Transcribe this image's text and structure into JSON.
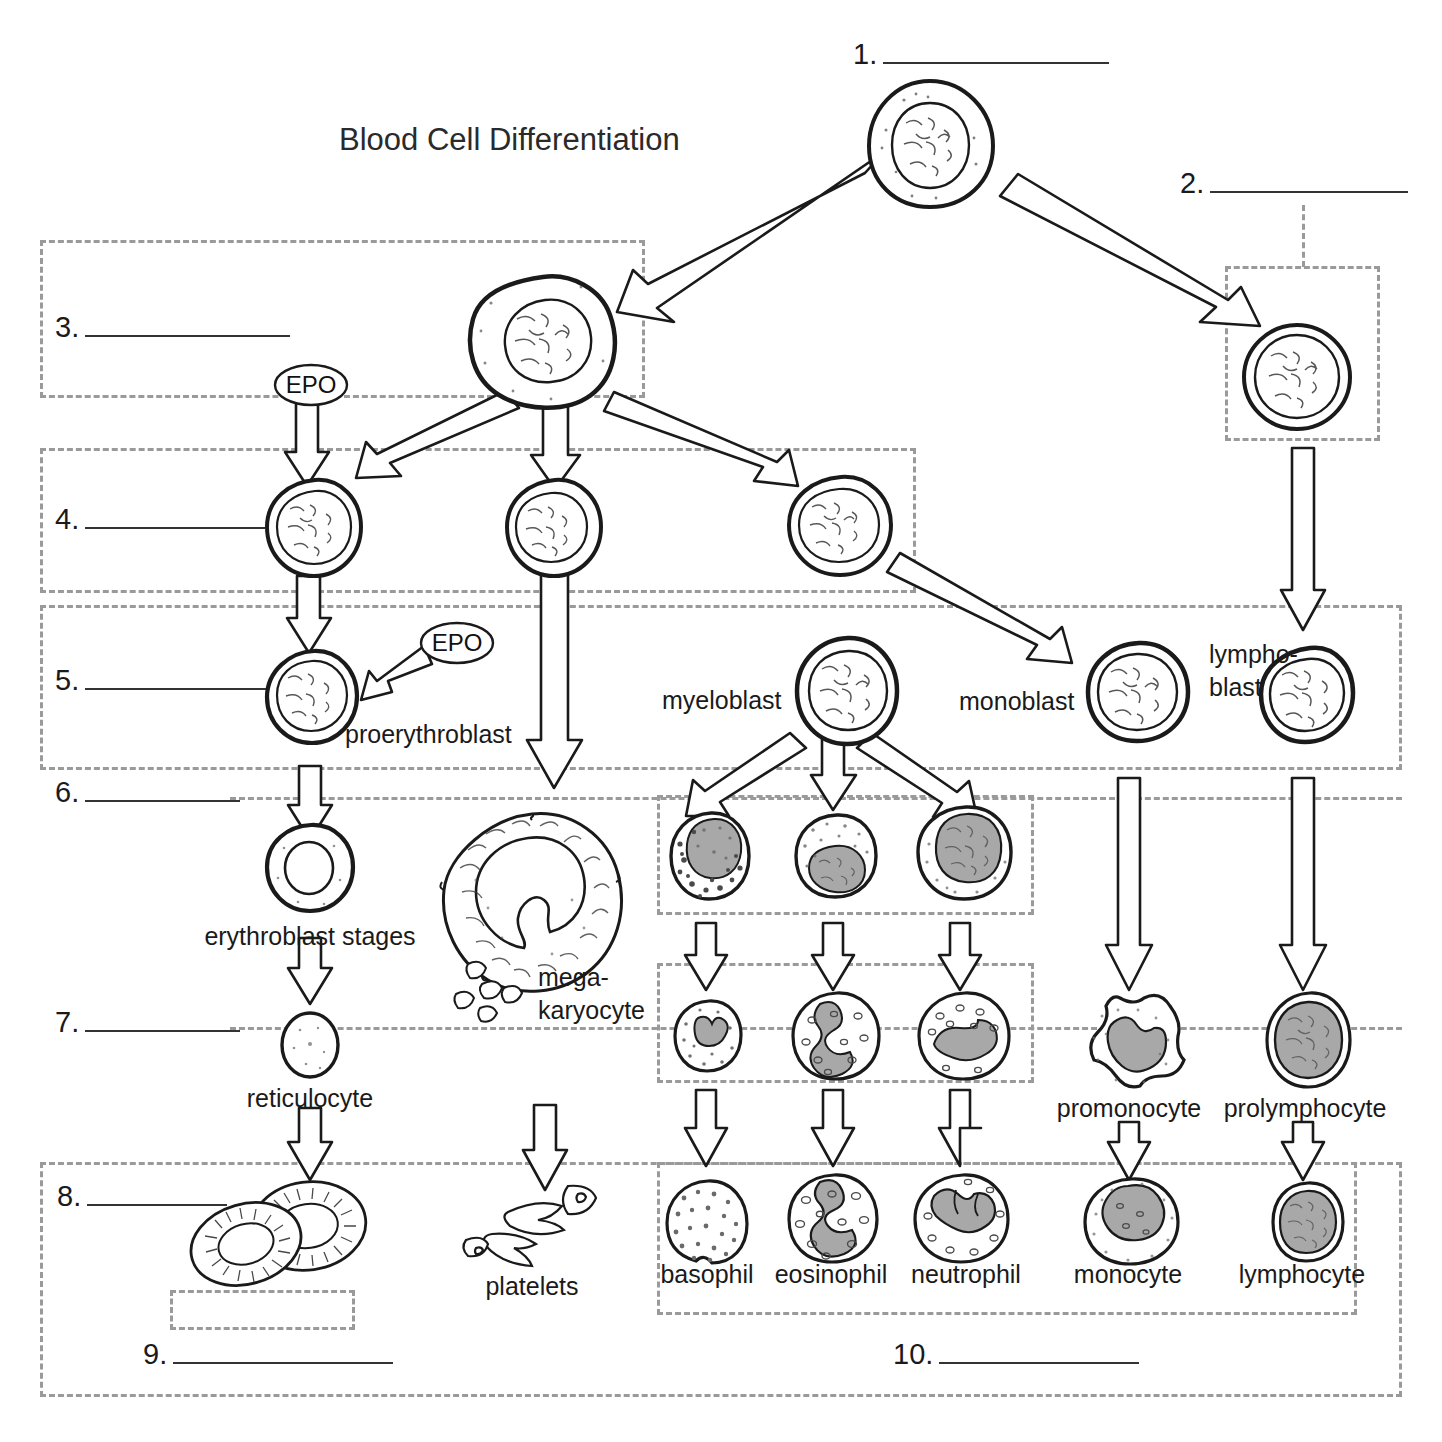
{
  "page": {
    "title": "Blood Cell Differentiation",
    "background": "#ffffff",
    "ink": "#1a1a1a",
    "dashed_box_color": "#9a9a9a",
    "cell_fill": "#ffffff",
    "nucleus_gray": "#a8a8a8"
  },
  "blanks": [
    {
      "id": 1,
      "number": "1.",
      "value": "",
      "line_width": 226
    },
    {
      "id": 2,
      "number": "2.",
      "value": "",
      "line_width": 198
    },
    {
      "id": 3,
      "number": "3.",
      "value": "",
      "line_width": 205
    },
    {
      "id": 4,
      "number": "4.",
      "value": "",
      "line_width": 180
    },
    {
      "id": 5,
      "number": "5.",
      "value": "",
      "line_width": 186
    },
    {
      "id": 6,
      "number": "6.",
      "value": "",
      "line_width": 155
    },
    {
      "id": 7,
      "number": "7.",
      "value": "",
      "line_width": 155
    },
    {
      "id": 8,
      "number": "8.",
      "value": "",
      "line_width": 140
    },
    {
      "id": 9,
      "number": "9.",
      "value": "",
      "line_width": 220
    },
    {
      "id": 10,
      "number": "10.",
      "value": "",
      "line_width": 200
    }
  ],
  "cell_labels": {
    "proerythroblast": "proerythroblast",
    "erythroblast_stages": "erythroblast stages",
    "reticulocyte": "reticulocyte",
    "megakaryocyte_line1": "mega-",
    "megakaryocyte_line2": "karyocyte",
    "platelets": "platelets",
    "myeloblast": "myeloblast",
    "monoblast": "monoblast",
    "lymphoblast_line1": "lympho-",
    "lymphoblast_line2": "blast",
    "basophil": "basophil",
    "eosinophil": "eosinophil",
    "neutrophil": "neutrophil",
    "monocyte": "monocyte",
    "lymphocyte": "lymphocyte",
    "promonocyte": "promonocyte",
    "prolymphocyte": "prolymphocyte"
  },
  "growth_factors": [
    {
      "name": "EPO",
      "label": "EPO",
      "target": "proerythroblast-precursor"
    },
    {
      "name": "EPO",
      "label": "EPO",
      "target": "proerythroblast"
    }
  ],
  "lineage": {
    "root": "hematopoietic stem cell (blank 1)",
    "branches": [
      {
        "from": "stem-cell",
        "to": "myeloid-stem-cell (blank 3)"
      },
      {
        "from": "stem-cell",
        "to": "lymphoid-stem-cell (blank 2)"
      },
      {
        "from": "myeloid-stem-cell",
        "to": "erythrocyte-line (blank 4)"
      },
      {
        "from": "myeloid-stem-cell",
        "to": "megakaryocyte-line"
      },
      {
        "from": "myeloid-stem-cell",
        "to": "myeloblast / monoblast"
      },
      {
        "from": "myeloblast",
        "to": "basophil"
      },
      {
        "from": "myeloblast",
        "to": "eosinophil"
      },
      {
        "from": "myeloblast",
        "to": "neutrophil"
      },
      {
        "from": "monoblast",
        "to": "promonocyte"
      },
      {
        "from": "promonocyte",
        "to": "monocyte"
      },
      {
        "from": "lymphoblast",
        "to": "prolymphocyte"
      },
      {
        "from": "prolymphocyte",
        "to": "lymphocyte"
      }
    ]
  }
}
